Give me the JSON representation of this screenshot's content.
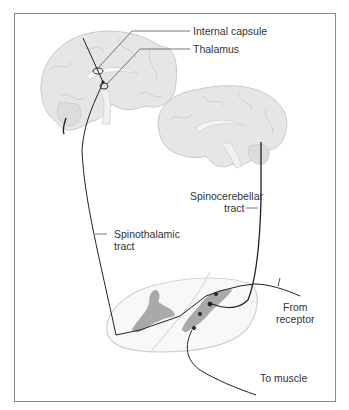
{
  "diagram": {
    "type": "neuroanatomy pathway illustration",
    "labels": {
      "internal_capsule": "Internal capsule",
      "thalamus": "Thalamus",
      "spinocerebellar_line1": "Spinocerebellar",
      "spinocerebellar_line2": "tract",
      "spinothalamic_line1": "Spinothalamic",
      "spinothalamic_line2": "tract",
      "from_receptor_line1": "From",
      "from_receptor_line2": "receptor",
      "to_muscle": "To muscle"
    },
    "structures": [
      "cerebrum-left-sagittal",
      "cerebrum-right-sagittal",
      "spinal-cord-cross-section"
    ],
    "colors": {
      "brain_fill": "#e4e4e4",
      "brain_outline": "#c8c8c8",
      "grey_matter": "#a9a9a9",
      "pathway": "#222222",
      "frame": "#8a8a8a",
      "text": "#333333"
    }
  }
}
